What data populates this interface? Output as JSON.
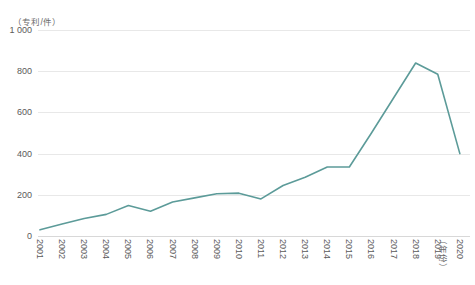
{
  "chart_data": {
    "type": "line",
    "title": "",
    "subtitle": "",
    "xlabel": "（年份）",
    "ylabel": "（专利/件）",
    "categories": [
      "2001",
      "2002",
      "2003",
      "2004",
      "2005",
      "2006",
      "2007",
      "2008",
      "2009",
      "2010",
      "2011",
      "2012",
      "2013",
      "2014",
      "2015",
      "2016",
      "2017",
      "2018",
      "2019",
      "2020"
    ],
    "values": [
      30,
      58,
      85,
      105,
      148,
      120,
      165,
      185,
      205,
      208,
      180,
      245,
      285,
      335,
      335,
      500,
      670,
      840,
      785,
      400
    ],
    "series": [
      {
        "name": "专利申请量",
        "values": [
          30,
          58,
          85,
          105,
          148,
          120,
          165,
          185,
          205,
          208,
          180,
          245,
          285,
          335,
          335,
          500,
          670,
          840,
          785,
          400
        ]
      }
    ],
    "ylim": [
      0,
      1000
    ],
    "yticks": [
      0,
      200,
      400,
      600,
      800,
      1000
    ],
    "ytick_labels": [
      "0",
      "200",
      "400",
      "600",
      "800",
      "1 000"
    ],
    "grid": true,
    "legend": "none",
    "line_color": "#5c9b99",
    "grid_color": "#e8e8e8",
    "tick_text_color": "#5a5a5a",
    "background_color": "#ffffff"
  }
}
